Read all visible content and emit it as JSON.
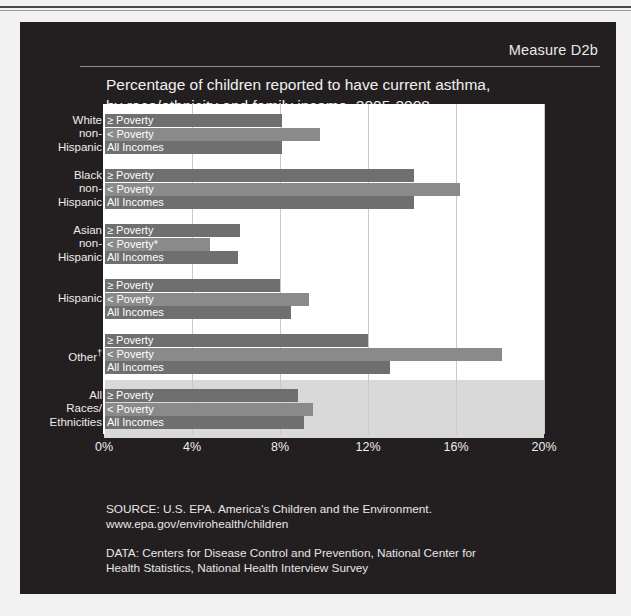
{
  "header": {
    "measure": "Measure D2b",
    "title_line1": "Percentage of children reported to have current asthma,",
    "title_line2": "by race/ethnicity and family income, 2005-2008"
  },
  "footer": {
    "source_line1": "SOURCE: U.S. EPA. America's Children and the Environment.",
    "source_line2": "www.epa.gov/envirohealth/children",
    "data_line1": "DATA: Centers for Disease Control and Prevention, National Center for",
    "data_line2": "Health Statistics, National Health Interview Survey"
  },
  "colors": {
    "slide_background": "#231f20",
    "plot_background": "#ffffff",
    "highlight_band": "#d9d9d9",
    "bar_primary": "#6f6f6f",
    "bar_secondary": "#8a8a8a",
    "gridline": "#c9c9c9",
    "text_light": "#ececec"
  },
  "chart_data": {
    "type": "bar",
    "orientation": "horizontal",
    "title": "Percentage of children reported to have current asthma, by race/ethnicity and family income, 2005-2008",
    "xlabel": "",
    "ylabel": "",
    "xlim": [
      0,
      20
    ],
    "xticks": [
      "0%",
      "4%",
      "8%",
      "12%",
      "16%",
      "20%"
    ],
    "xtick_values": [
      0,
      4,
      8,
      12,
      16,
      20
    ],
    "grid": true,
    "legend": "none",
    "series_names": [
      "≥ Poverty",
      "< Poverty",
      "All Incomes"
    ],
    "footnote_marker_poverty": "*",
    "footnote_marker_other": "†",
    "categories": [
      {
        "name_lines": [
          "White",
          "non-",
          "Hispanic"
        ],
        "highlight": false,
        "bars": [
          {
            "label": "≥ Poverty",
            "value": 8.1
          },
          {
            "label": "< Poverty",
            "value": 9.8
          },
          {
            "label": "All Incomes",
            "value": 8.1
          }
        ]
      },
      {
        "name_lines": [
          "Black",
          "non-",
          "Hispanic"
        ],
        "highlight": false,
        "bars": [
          {
            "label": "≥ Poverty",
            "value": 14.1
          },
          {
            "label": "< Poverty",
            "value": 16.2
          },
          {
            "label": "All Incomes",
            "value": 14.1
          }
        ]
      },
      {
        "name_lines": [
          "Asian",
          "non-",
          "Hispanic"
        ],
        "highlight": false,
        "bars": [
          {
            "label": "≥ Poverty",
            "value": 6.2
          },
          {
            "label": "< Poverty*",
            "value": 4.8
          },
          {
            "label": "All Incomes",
            "value": 6.1
          }
        ]
      },
      {
        "name_lines": [
          "Hispanic"
        ],
        "highlight": false,
        "bars": [
          {
            "label": "≥ Poverty",
            "value": 8.0
          },
          {
            "label": "< Poverty",
            "value": 9.3
          },
          {
            "label": "All Incomes",
            "value": 8.5
          }
        ]
      },
      {
        "name_lines": [
          "Other†"
        ],
        "highlight": false,
        "bars": [
          {
            "label": "≥ Poverty",
            "value": 12.0
          },
          {
            "label": "< Poverty",
            "value": 18.1
          },
          {
            "label": "All Incomes",
            "value": 13.0
          }
        ]
      },
      {
        "name_lines": [
          "All",
          "Races/",
          "Ethnicities"
        ],
        "highlight": true,
        "bars": [
          {
            "label": "≥ Poverty",
            "value": 8.8
          },
          {
            "label": "< Poverty",
            "value": 9.5
          },
          {
            "label": "All Incomes",
            "value": 9.1
          }
        ]
      }
    ]
  }
}
